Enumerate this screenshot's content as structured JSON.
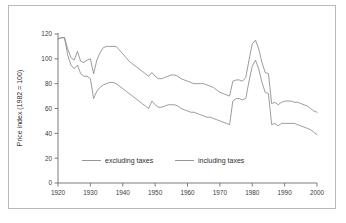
{
  "figure": {
    "border_color": "#b9b9b9",
    "background": "#ffffff"
  },
  "chart_data": {
    "type": "line",
    "title": "",
    "xlabel": "",
    "ylabel": "Price index (1982 = 100)",
    "xlim": [
      1920,
      2000
    ],
    "ylim": [
      0,
      120
    ],
    "xticks": [
      1920,
      1930,
      1940,
      1950,
      1960,
      1970,
      1980,
      1990,
      2000
    ],
    "xtick_labels": [
      "1920",
      "1930",
      "1940",
      "1950",
      "1960",
      "1970",
      "1980",
      "1990",
      "2000"
    ],
    "yticks": [
      0,
      20,
      40,
      60,
      80,
      100,
      120
    ],
    "ytick_labels": [
      "0",
      "20",
      "40",
      "60",
      "80",
      "100",
      "120"
    ],
    "grid": false,
    "legend_position": "lower-center",
    "line_color": "#8a8a8a",
    "x": [
      1920,
      1921,
      1922,
      1923,
      1924,
      1925,
      1926,
      1927,
      1928,
      1929,
      1930,
      1931,
      1932,
      1933,
      1934,
      1935,
      1936,
      1937,
      1938,
      1939,
      1940,
      1941,
      1942,
      1943,
      1944,
      1945,
      1946,
      1947,
      1948,
      1949,
      1950,
      1951,
      1952,
      1953,
      1954,
      1955,
      1956,
      1957,
      1958,
      1959,
      1960,
      1961,
      1962,
      1963,
      1964,
      1965,
      1966,
      1967,
      1968,
      1969,
      1970,
      1971,
      1972,
      1973,
      1974,
      1975,
      1976,
      1977,
      1978,
      1979,
      1980,
      1981,
      1982,
      1983,
      1984,
      1985,
      1986,
      1987,
      1988,
      1989,
      1990,
      1991,
      1992,
      1993,
      1994,
      1995,
      1996,
      1997,
      1998,
      1999,
      2000
    ],
    "series": [
      {
        "name": "including taxes",
        "values": [
          116,
          117,
          117,
          108,
          101,
          99,
          106,
          98,
          97,
          99,
          100,
          88,
          99,
          105,
          109,
          110,
          110,
          110,
          110,
          107,
          104,
          101,
          98,
          96,
          94,
          92,
          90,
          88,
          86,
          89,
          86,
          84,
          84,
          85,
          86,
          87,
          87,
          86,
          84,
          83,
          82,
          81,
          80,
          80,
          80,
          80,
          79,
          78,
          77,
          75,
          73,
          72,
          71,
          70,
          82,
          83,
          83,
          82,
          85,
          99,
          112,
          115,
          108,
          97,
          89,
          88,
          64,
          65,
          63,
          65,
          66,
          66,
          66,
          65,
          65,
          64,
          63,
          62,
          60,
          58,
          57
        ]
      },
      {
        "name": "excluding taxes",
        "values": [
          116,
          117,
          117,
          103,
          95,
          92,
          95,
          88,
          86,
          86,
          84,
          68,
          74,
          77,
          79,
          80,
          81,
          81,
          80,
          78,
          76,
          74,
          72,
          70,
          68,
          66,
          64,
          62,
          60,
          66,
          63,
          61,
          61,
          62,
          63,
          63,
          63,
          62,
          60,
          59,
          58,
          57,
          57,
          56,
          55,
          54,
          53,
          53,
          52,
          51,
          50,
          49,
          48,
          47,
          66,
          68,
          68,
          67,
          68,
          82,
          94,
          99,
          92,
          81,
          73,
          72,
          47,
          48,
          46,
          48,
          48,
          48,
          48,
          48,
          47,
          46,
          45,
          44,
          43,
          41,
          39
        ]
      }
    ],
    "legend": [
      {
        "label": "excluding taxes"
      },
      {
        "label": "including taxes"
      }
    ]
  }
}
